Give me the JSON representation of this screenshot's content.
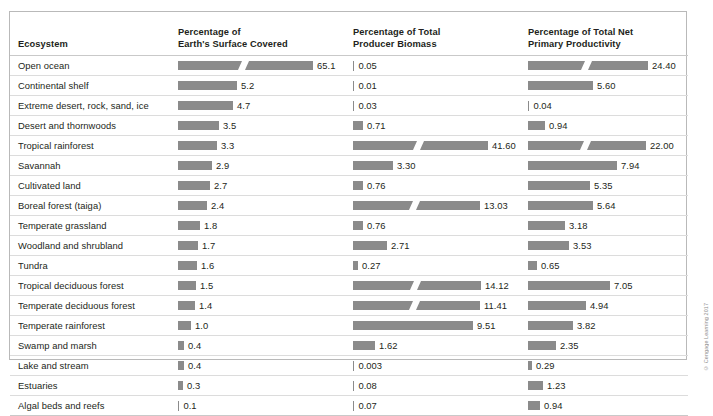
{
  "table": {
    "columns": [
      {
        "key": "name",
        "label": "Ecosystem",
        "line1": "Ecosystem",
        "line2": ""
      },
      {
        "key": "surface",
        "line1": "Percentage of",
        "line2": "Earth's Surface Covered"
      },
      {
        "key": "biomass",
        "line1": "Percentage of Total",
        "line2": "Producer Biomass"
      },
      {
        "key": "npp",
        "line1": "Percentage of Total Net",
        "line2": "Primary Productivity"
      }
    ],
    "rows": [
      {
        "name": "Open ocean",
        "surface": "65.1",
        "biomass": "0.05",
        "npp": "24.40"
      },
      {
        "name": "Continental shelf",
        "surface": "5.2",
        "biomass": "0.01",
        "npp": "5.60"
      },
      {
        "name": "Extreme desert, rock, sand, ice",
        "surface": "4.7",
        "biomass": "0.03",
        "npp": "0.04"
      },
      {
        "name": "Desert and thornwoods",
        "surface": "3.5",
        "biomass": "0.71",
        "npp": "0.94"
      },
      {
        "name": "Tropical rainforest",
        "surface": "3.3",
        "biomass": "41.60",
        "npp": "22.00"
      },
      {
        "name": "Savannah",
        "surface": "2.9",
        "biomass": "3.30",
        "npp": "7.94"
      },
      {
        "name": "Cultivated land",
        "surface": "2.7",
        "biomass": "0.76",
        "npp": "5.35"
      },
      {
        "name": "Boreal forest (taiga)",
        "surface": "2.4",
        "biomass": "13.03",
        "npp": "5.64"
      },
      {
        "name": "Temperate grassland",
        "surface": "1.8",
        "biomass": "0.76",
        "npp": "3.18"
      },
      {
        "name": "Woodland and shrubland",
        "surface": "1.7",
        "biomass": "2.71",
        "npp": "3.53"
      },
      {
        "name": "Tundra",
        "surface": "1.6",
        "biomass": "0.27",
        "npp": "0.65"
      },
      {
        "name": "Tropical deciduous forest",
        "surface": "1.5",
        "biomass": "14.12",
        "npp": "7.05"
      },
      {
        "name": "Temperate deciduous forest",
        "surface": "1.4",
        "biomass": "11.41",
        "npp": "4.94"
      },
      {
        "name": "Temperate rainforest",
        "surface": "1.0",
        "biomass": "9.51",
        "npp": "3.82"
      },
      {
        "name": "Swamp and marsh",
        "surface": "0.4",
        "biomass": "1.62",
        "npp": "2.35"
      },
      {
        "name": "Lake and stream",
        "surface": "0.4",
        "biomass": "0.003",
        "npp": "0.29"
      },
      {
        "name": "Estuaries",
        "surface": "0.3",
        "biomass": "0.08",
        "npp": "1.23"
      },
      {
        "name": "Algal beds and reefs",
        "surface": "0.1",
        "biomass": "0.07",
        "npp": "0.94"
      }
    ]
  },
  "chart_data": {
    "type": "bar",
    "orientation": "horizontal",
    "grid": false,
    "legend": null,
    "bar_color": "#8b8b8b",
    "categories": [
      "Open ocean",
      "Continental shelf",
      "Extreme desert, rock, sand, ice",
      "Desert and thornwoods",
      "Tropical rainforest",
      "Savannah",
      "Cultivated land",
      "Boreal forest (taiga)",
      "Temperate grassland",
      "Woodland and shrubland",
      "Tundra",
      "Tropical deciduous forest",
      "Temperate deciduous forest",
      "Temperate rainforest",
      "Swamp and marsh",
      "Lake and stream",
      "Estuaries",
      "Algal beds and reefs"
    ],
    "series": [
      {
        "name": "Percentage of Earth's Surface Covered",
        "unit": "%",
        "axis_break": true,
        "values": [
          65.1,
          5.2,
          4.7,
          3.5,
          3.3,
          2.9,
          2.7,
          2.4,
          1.8,
          1.7,
          1.6,
          1.5,
          1.4,
          1.0,
          0.4,
          0.4,
          0.3,
          0.1
        ],
        "bar_pixel_widths": [
          135,
          59,
          55,
          41,
          39,
          34,
          32,
          29,
          22,
          20,
          19,
          18,
          17,
          13,
          6,
          6,
          5,
          2
        ],
        "broken_bars": [
          "Open ocean"
        ]
      },
      {
        "name": "Percentage of Total Producer Biomass",
        "unit": "%",
        "axis_break": true,
        "values": [
          0.05,
          0.01,
          0.03,
          0.71,
          41.6,
          3.3,
          0.76,
          13.03,
          0.76,
          2.71,
          0.27,
          14.12,
          11.41,
          9.51,
          1.62,
          0.003,
          0.08,
          0.07
        ],
        "bar_pixel_widths": [
          2,
          2,
          2,
          10,
          135,
          40,
          10,
          127,
          10,
          34,
          5,
          128,
          127,
          120,
          22,
          2,
          2,
          2
        ],
        "broken_bars": [
          "Tropical rainforest",
          "Boreal forest (taiga)",
          "Tropical deciduous forest",
          "Temperate deciduous forest"
        ]
      },
      {
        "name": "Percentage of Total Net Primary Productivity",
        "unit": "%",
        "axis_break": true,
        "values": [
          24.4,
          5.6,
          0.04,
          0.94,
          22.0,
          7.94,
          5.35,
          5.64,
          3.18,
          3.53,
          0.65,
          7.05,
          4.94,
          3.82,
          2.35,
          0.29,
          1.23,
          0.94
        ],
        "bar_pixel_widths": [
          120,
          65,
          2,
          17,
          118,
          89,
          62,
          65,
          37,
          41,
          9,
          82,
          58,
          45,
          28,
          4,
          15,
          12
        ],
        "broken_bars": [
          "Open ocean",
          "Tropical rainforest"
        ]
      }
    ]
  },
  "footer": {
    "copyright": "© Cengage Learning 2017"
  }
}
